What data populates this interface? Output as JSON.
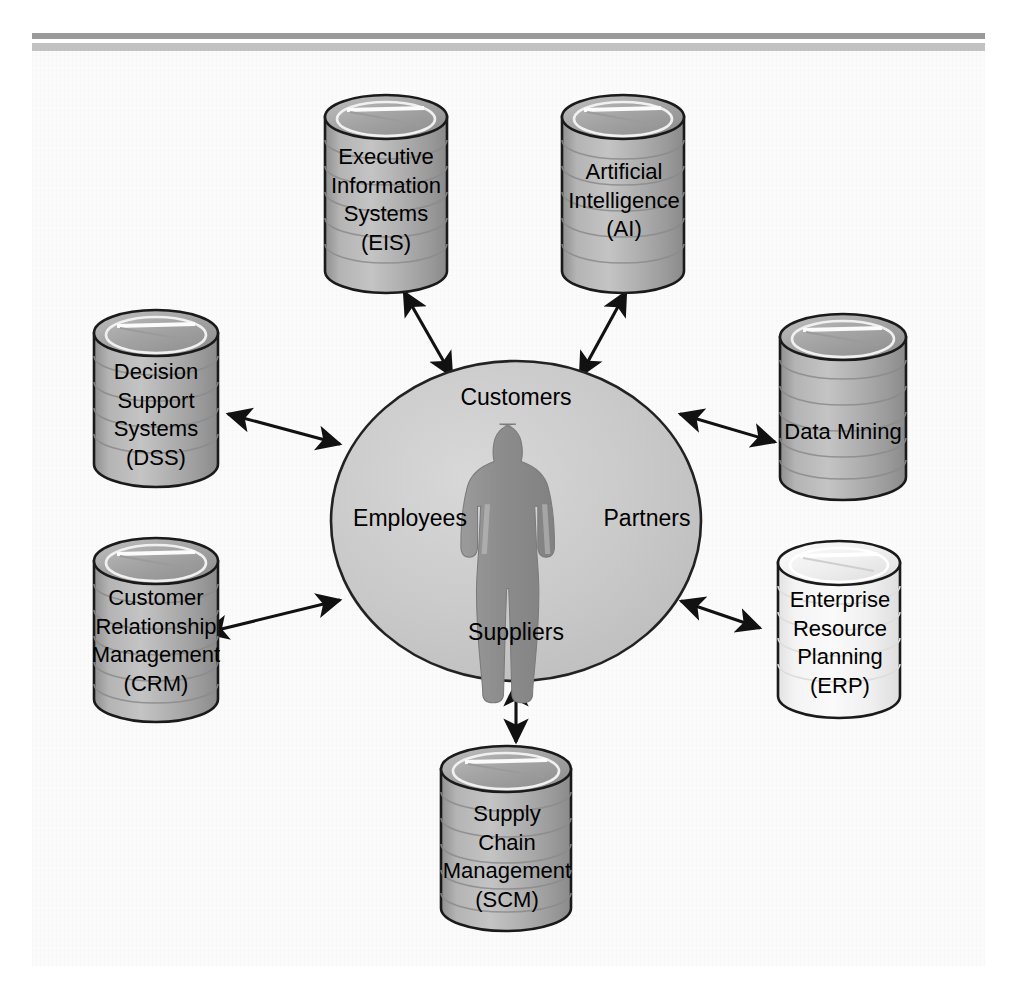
{
  "figure": {
    "type": "enterprise-systems-hub-diagram",
    "background_color": "#fbfbfb",
    "rule_dark_color": "#9a9a9a",
    "rule_light_color": "#c2c2c2",
    "stroke_color": "#1a1a1a",
    "cylinder_fill": "#a8a8a8",
    "cylinder_fill_light": "#f2f2f2",
    "ellipse_fill": "#c9c9c9",
    "person_fill": "#8e8e8e"
  },
  "center": {
    "name": "central-organization-ellipse",
    "shape": "ellipse",
    "labels": {
      "top": "Customers",
      "left": "Employees",
      "right": "Partners",
      "bottom": "Suppliers"
    },
    "person_icon": "person-silhouette-icon"
  },
  "nodes": [
    {
      "id": "eis",
      "name": "database-cylinder-eis",
      "label": "Executive\nInformation\nSystems\n(EIS)",
      "shade": "dark",
      "position": "top-left"
    },
    {
      "id": "ai",
      "name": "database-cylinder-ai",
      "label": "Artificial\nIntelligence\n(AI)",
      "shade": "dark",
      "position": "top-right"
    },
    {
      "id": "dss",
      "name": "database-cylinder-dss",
      "label": "Decision\nSupport\nSystems\n(DSS)",
      "shade": "dark",
      "position": "left-upper"
    },
    {
      "id": "data-mining",
      "name": "database-cylinder-data-mining",
      "label": "Data Mining",
      "shade": "dark",
      "position": "right-upper"
    },
    {
      "id": "crm",
      "name": "database-cylinder-crm",
      "label": "Customer\nRelationship\nManagement\n(CRM)",
      "shade": "dark",
      "position": "left-lower"
    },
    {
      "id": "erp",
      "name": "database-cylinder-erp",
      "label": "Enterprise\nResource\nPlanning\n(ERP)",
      "shade": "light",
      "position": "right-lower"
    },
    {
      "id": "scm",
      "name": "database-cylinder-scm",
      "label": "Supply\nChain\nManagement\n(SCM)",
      "shade": "dark",
      "position": "bottom"
    }
  ],
  "connectors": [
    {
      "name": "connector-eis",
      "from": "center",
      "to": "eis",
      "style": "double-headed-arrow"
    },
    {
      "name": "connector-ai",
      "from": "center",
      "to": "ai",
      "style": "double-headed-arrow"
    },
    {
      "name": "connector-dss",
      "from": "center",
      "to": "dss",
      "style": "double-headed-arrow"
    },
    {
      "name": "connector-data-mining",
      "from": "center",
      "to": "data-mining",
      "style": "double-headed-arrow"
    },
    {
      "name": "connector-crm",
      "from": "center",
      "to": "crm",
      "style": "double-headed-arrow"
    },
    {
      "name": "connector-erp",
      "from": "center",
      "to": "erp",
      "style": "double-headed-arrow"
    },
    {
      "name": "connector-scm",
      "from": "center",
      "to": "scm",
      "style": "double-headed-arrow"
    }
  ]
}
